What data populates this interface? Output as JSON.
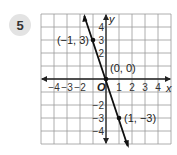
{
  "problem": {
    "number": "5"
  },
  "chart_data": {
    "type": "line",
    "title": "",
    "xlabel": "x",
    "ylabel": "y",
    "xlim": [
      -5,
      5
    ],
    "ylim": [
      -5,
      5
    ],
    "grid": true,
    "x_ticks": [
      "−4",
      "−3",
      "−2",
      "1",
      "2",
      "3",
      "4"
    ],
    "y_ticks": [
      "4",
      "3",
      "2",
      "−2",
      "−3",
      "−4"
    ],
    "origin_label": "O",
    "series": [
      {
        "name": "y = -3x",
        "x": [
          -1,
          0,
          1
        ],
        "y": [
          3,
          0,
          -3
        ]
      }
    ],
    "points": [
      {
        "label": "(−1, 3)",
        "x": -1,
        "y": 3
      },
      {
        "label": "(0, 0)",
        "x": 0,
        "y": 0
      },
      {
        "label": "(1, −3)",
        "x": 1,
        "y": -3
      }
    ]
  }
}
